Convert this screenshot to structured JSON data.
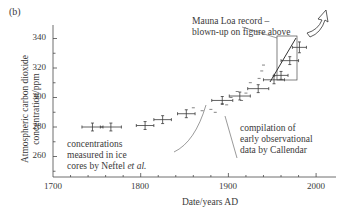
{
  "panel_label": "(b)",
  "chart_data": {
    "type": "scatter",
    "title": "",
    "xlabel": "Date/years AD",
    "ylabel": "Atmospheric carbon dioxide concentration/ppm",
    "xlim": [
      1700,
      2020
    ],
    "ylim": [
      247,
      348
    ],
    "x_ticks": [
      1700,
      1800,
      1900,
      2000
    ],
    "y_ticks": [
      260,
      280,
      300,
      320,
      340
    ],
    "grid": false,
    "error_bars": true,
    "series": [
      {
        "name": "concentrations measured in ice cores by Neftel et al.",
        "points": [
          {
            "x": 1745,
            "y": 280,
            "xerr": 12,
            "yerr": 2
          },
          {
            "x": 1766,
            "y": 280,
            "xerr": 12,
            "yerr": 2
          },
          {
            "x": 1805,
            "y": 281,
            "xerr": 10,
            "yerr": 2
          },
          {
            "x": 1825,
            "y": 285,
            "xerr": 10,
            "yerr": 2
          },
          {
            "x": 1852,
            "y": 289,
            "xerr": 10,
            "yerr": 2
          },
          {
            "x": 1893,
            "y": 298,
            "xerr": 12,
            "yerr": 2
          },
          {
            "x": 1913,
            "y": 301,
            "xerr": 12,
            "yerr": 2
          },
          {
            "x": 1934,
            "y": 306,
            "xerr": 12,
            "yerr": 2
          },
          {
            "x": 1952,
            "y": 312,
            "xerr": 12,
            "yerr": 2
          },
          {
            "x": 1960,
            "y": 315,
            "xerr": 8,
            "yerr": 2
          },
          {
            "x": 1970,
            "y": 325,
            "xerr": 10,
            "yerr": 2
          },
          {
            "x": 1981,
            "y": 334,
            "xerr": 8,
            "yerr": 3
          }
        ]
      },
      {
        "name": "compilation of early observational data by Callendar",
        "points": [
          {
            "x": 1860,
            "y": 293
          },
          {
            "x": 1870,
            "y": 291
          },
          {
            "x": 1880,
            "y": 292
          },
          {
            "x": 1885,
            "y": 290
          },
          {
            "x": 1893,
            "y": 296
          },
          {
            "x": 1898,
            "y": 295
          },
          {
            "x": 1903,
            "y": 300
          },
          {
            "x": 1910,
            "y": 304
          },
          {
            "x": 1915,
            "y": 298
          },
          {
            "x": 1920,
            "y": 303
          },
          {
            "x": 1925,
            "y": 310
          },
          {
            "x": 1935,
            "y": 313
          },
          {
            "x": 1938,
            "y": 318
          },
          {
            "x": 1940,
            "y": 322
          }
        ]
      },
      {
        "name": "Mauna Loa record",
        "points": [
          {
            "x": 1958,
            "y": 315
          },
          {
            "x": 1980,
            "y": 338
          }
        ]
      }
    ],
    "annotations": [
      {
        "text": "Mauna Loa record – blown-up on figure above",
        "target": [
          1968,
          340
        ]
      },
      {
        "text": "concentrations measured in ice cores by Neftel et al.",
        "target": [
          1874,
          297
        ]
      },
      {
        "text": "compilation of early observational data by Callendar",
        "target": [
          1882,
          293
        ]
      }
    ],
    "inset_box": {
      "x": [
        1955,
        1980
      ],
      "y": [
        312,
        342
      ]
    }
  },
  "axis": {
    "y_tick_labels": [
      "340",
      "320",
      "300",
      "280",
      "260"
    ],
    "x_tick_labels": [
      "1700",
      "1800",
      "1900",
      "2000"
    ],
    "xlabel": "Date/years AD",
    "ylabel_line1": "Atmospheric carbon dioxide",
    "ylabel_line2": "concentration/ppm"
  },
  "annotations": {
    "mauna_loa_line1": "Mauna Loa record –",
    "mauna_loa_line2": "blown-up on figure above",
    "ice_line1": "concentrations",
    "ice_line2": "measured in ice",
    "ice_line3_prefix": "cores by Neftel ",
    "ice_line3_italic": "et al.",
    "callendar_line1": "compilation of",
    "callendar_line2": "early observational",
    "callendar_line3": "data by Callendar"
  }
}
